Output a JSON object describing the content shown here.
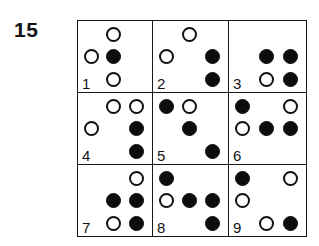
{
  "figure": {
    "item_number": "15",
    "grid": {
      "rows": 3,
      "columns": 3
    },
    "legend": {
      "filled_symbol": "filled-circle",
      "open_symbol": "open-circle",
      "empty_symbol": "empty-slot"
    },
    "cells": [
      {
        "label": "1",
        "dots": [
          [
            "none",
            "open",
            "none"
          ],
          [
            "open",
            "filled",
            "none"
          ],
          [
            "none",
            "open",
            "none"
          ]
        ]
      },
      {
        "label": "2",
        "dots": [
          [
            "none",
            "open",
            "none"
          ],
          [
            "open",
            "none",
            "filled"
          ],
          [
            "none",
            "none",
            "filled"
          ]
        ]
      },
      {
        "label": "3",
        "dots": [
          [
            "none",
            "none",
            "none"
          ],
          [
            "none",
            "filled",
            "filled"
          ],
          [
            "none",
            "open",
            "filled"
          ]
        ]
      },
      {
        "label": "4",
        "dots": [
          [
            "none",
            "open",
            "open"
          ],
          [
            "open",
            "none",
            "filled"
          ],
          [
            "none",
            "none",
            "filled"
          ]
        ]
      },
      {
        "label": "5",
        "dots": [
          [
            "filled",
            "open",
            "none"
          ],
          [
            "none",
            "filled",
            "none"
          ],
          [
            "none",
            "none",
            "filled"
          ]
        ]
      },
      {
        "label": "6",
        "dots": [
          [
            "filled",
            "none",
            "open"
          ],
          [
            "open",
            "filled",
            "filled"
          ],
          [
            "none",
            "none",
            "none"
          ]
        ]
      },
      {
        "label": "7",
        "dots": [
          [
            "none",
            "none",
            "open"
          ],
          [
            "none",
            "filled",
            "filled"
          ],
          [
            "none",
            "open",
            "filled"
          ]
        ]
      },
      {
        "label": "8",
        "dots": [
          [
            "filled",
            "none",
            "none"
          ],
          [
            "open",
            "filled",
            "filled"
          ],
          [
            "none",
            "none",
            "filled"
          ]
        ]
      },
      {
        "label": "9",
        "dots": [
          [
            "filled",
            "none",
            "open"
          ],
          [
            "open",
            "none",
            "none"
          ],
          [
            "none",
            "open",
            "filled"
          ]
        ]
      }
    ]
  }
}
